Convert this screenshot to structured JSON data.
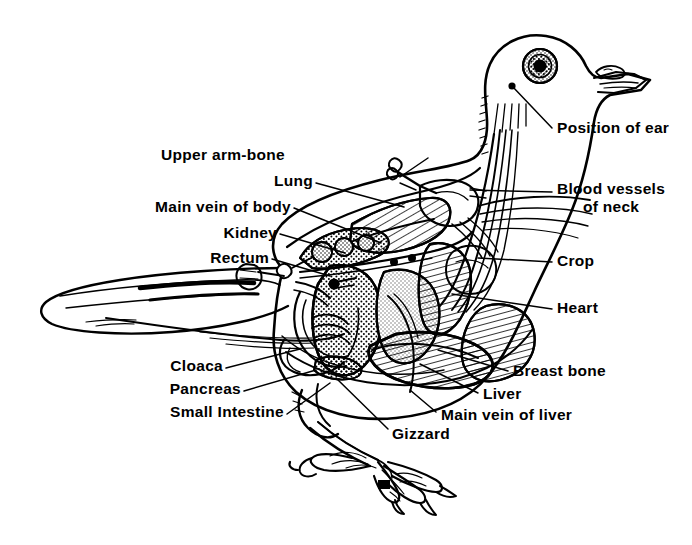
{
  "figure": {
    "style": "black-and-white line drawing with hatching and stippling",
    "background_color": "#ffffff",
    "ink_color": "#000000"
  },
  "labels": [
    {
      "id": "upper-arm-bone",
      "text": "Upper arm-bone",
      "align": "right",
      "x": 425,
      "y": 146,
      "leader": [
        [
          428,
          158
        ],
        [
          400,
          177
        ]
      ]
    },
    {
      "id": "lung",
      "text": "Lung",
      "align": "right",
      "x": 310,
      "y": 172,
      "leader": [
        [
          316,
          183
        ],
        [
          404,
          207
        ]
      ]
    },
    {
      "id": "main-vein-of-body",
      "text": "Main vein of body",
      "align": "right",
      "x": 290,
      "y": 198,
      "leader": [
        [
          294,
          208
        ],
        [
          381,
          243
        ]
      ]
    },
    {
      "id": "kidney",
      "text": "Kidney",
      "align": "right",
      "x": 276,
      "y": 224,
      "leader": [
        [
          280,
          234
        ],
        [
          345,
          253
        ]
      ]
    },
    {
      "id": "rectum",
      "text": "Rectum",
      "align": "right",
      "x": 268,
      "y": 249,
      "leader": [
        [
          272,
          259
        ],
        [
          330,
          276
        ]
      ]
    },
    {
      "id": "cloaca",
      "text": "Cloaca",
      "align": "right",
      "x": 222,
      "y": 360,
      "leader": [
        [
          226,
          368
        ],
        [
          300,
          349
        ]
      ]
    },
    {
      "id": "pancreas",
      "text": "Pancreas",
      "align": "right",
      "x": 240,
      "y": 383,
      "leader": [
        [
          244,
          391
        ],
        [
          316,
          370
        ]
      ]
    },
    {
      "id": "small-intestine",
      "text": "Small Intestine",
      "align": "right",
      "x": 283,
      "y": 408,
      "leader": [
        [
          287,
          414
        ],
        [
          330,
          383
        ]
      ]
    },
    {
      "id": "gizzard",
      "text": "Gizzard",
      "align": "left",
      "x": 390,
      "y": 430,
      "leader": [
        [
          388,
          429
        ],
        [
          336,
          378
        ]
      ]
    },
    {
      "id": "position-of-ear",
      "text": "Position of ear",
      "align": "left",
      "x": 556,
      "y": 124,
      "leader": [
        [
          552,
          128
        ],
        [
          512,
          86
        ]
      ]
    },
    {
      "id": "blood-vessels-of-neck",
      "text": "Blood vessels\nof neck",
      "align": "left",
      "x": 556,
      "y": 186,
      "leader": [
        [
          552,
          192
        ],
        [
          478,
          190
        ]
      ]
    },
    {
      "id": "crop",
      "text": "Crop",
      "align": "left",
      "x": 556,
      "y": 257,
      "leader": [
        [
          552,
          262
        ],
        [
          480,
          258
        ]
      ]
    },
    {
      "id": "heart",
      "text": "Heart",
      "align": "left",
      "x": 556,
      "y": 304,
      "leader": [
        [
          552,
          309
        ],
        [
          455,
          296
        ]
      ]
    },
    {
      "id": "breast-bone",
      "text": "Breast bone",
      "align": "left",
      "x": 512,
      "y": 367,
      "leader": [
        [
          508,
          371
        ],
        [
          440,
          352
        ]
      ]
    },
    {
      "id": "liver",
      "text": "Liver",
      "align": "left",
      "x": 482,
      "y": 390,
      "leader": [
        [
          478,
          393
        ],
        [
          423,
          366
        ]
      ]
    },
    {
      "id": "main-vein-of-liver",
      "text": "Main vein of liver",
      "align": "left",
      "x": 440,
      "y": 411,
      "leader": [
        [
          436,
          412
        ],
        [
          412,
          392
        ]
      ]
    }
  ],
  "label_texts": {
    "upper_arm_bone": "Upper arm-bone",
    "lung": "Lung",
    "main_vein_of_body": "Main vein of body",
    "kidney": "Kidney",
    "rectum": "Rectum",
    "cloaca": "Cloaca",
    "pancreas": "Pancreas",
    "small_intestine": "Small Intestine",
    "gizzard": "Gizzard",
    "position_of_ear": "Position of ear",
    "blood_vessels_of_neck_1": "Blood vessels",
    "blood_vessels_of_neck_2": "of neck",
    "crop": "Crop",
    "heart": "Heart",
    "breast_bone": "Breast bone",
    "liver": "Liver",
    "main_vein_of_liver": "Main vein of liver"
  }
}
